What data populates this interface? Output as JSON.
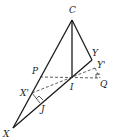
{
  "figure": {
    "type": "geometry-diagram",
    "points": {
      "C": "C",
      "X": "X",
      "Y": "Y",
      "I": "I",
      "P": "P",
      "Q": "Q",
      "X_prime": "X'",
      "Y_prime": "Y'",
      "J": "J"
    },
    "segments": [
      {
        "from": "C",
        "to": "X",
        "style": "solid"
      },
      {
        "from": "C",
        "to": "I",
        "style": "solid"
      },
      {
        "from": "C",
        "to": "Y",
        "style": "solid"
      },
      {
        "from": "X",
        "to": "Y",
        "style": "solid"
      },
      {
        "from": "X'",
        "to": "J",
        "style": "solid"
      },
      {
        "from": "P",
        "to": "Q",
        "style": "dashed"
      },
      {
        "from": "X'",
        "to": "Y'",
        "style": "dashed"
      },
      {
        "from": "Y'",
        "to": "Q",
        "style": "dashed"
      }
    ]
  }
}
